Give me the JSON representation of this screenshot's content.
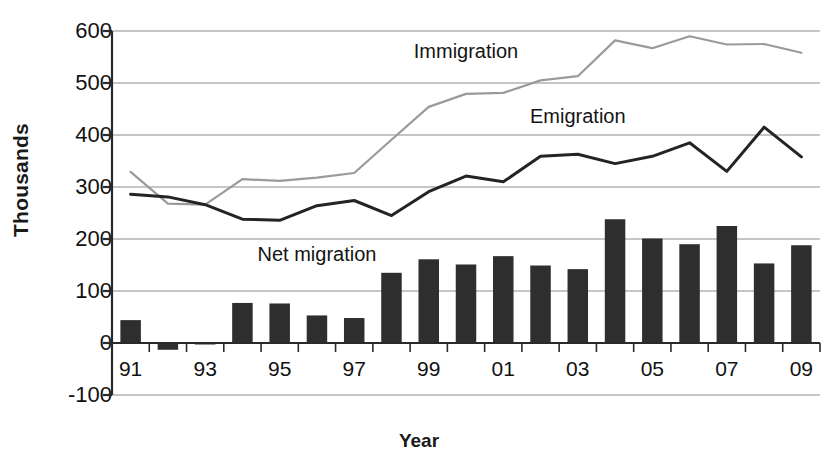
{
  "chart_data": {
    "type": "bar",
    "title": "",
    "xlabel": "Year",
    "ylabel": "Thousands",
    "ylim": [
      -100,
      600
    ],
    "ytick_values": [
      600,
      500,
      400,
      300,
      200,
      100,
      0,
      -100
    ],
    "ytick_labels": [
      "600",
      "500",
      "400",
      "300",
      "200",
      "100",
      "0",
      "-100"
    ],
    "grid": true,
    "legend_position": "inline-annotations",
    "categories": [
      "1991",
      "1992",
      "1993",
      "1994",
      "1995",
      "1996",
      "1997",
      "1998",
      "1999",
      "2000",
      "2001",
      "2002",
      "2003",
      "2004",
      "2005",
      "2006",
      "2007",
      "2008",
      "2009"
    ],
    "xtick_labels": [
      "91",
      "93",
      "95",
      "97",
      "99",
      "01",
      "03",
      "05",
      "07",
      "09"
    ],
    "xtick_categories": [
      "1991",
      "1993",
      "1995",
      "1997",
      "1999",
      "2001",
      "2003",
      "2005",
      "2007",
      "2009"
    ],
    "series": [
      {
        "name": "Net migration",
        "type": "bar",
        "color": "#2e2e2e",
        "values": [
          44,
          -13,
          -1,
          77,
          76,
          53,
          48,
          135,
          161,
          151,
          167,
          149,
          142,
          238,
          201,
          190,
          225,
          153,
          188
        ]
      },
      {
        "name": "Immigration",
        "type": "line",
        "color": "#9a9a9a",
        "values": [
          329,
          268,
          266,
          315,
          312,
          318,
          327,
          391,
          454,
          479,
          481,
          505,
          513,
          582,
          567,
          590,
          574,
          575,
          558
        ]
      },
      {
        "name": "Emigration",
        "type": "line",
        "color": "#242424",
        "values": [
          286,
          281,
          266,
          238,
          236,
          264,
          274,
          245,
          291,
          321,
          310,
          359,
          363,
          345,
          359,
          385,
          330,
          415,
          358
        ]
      }
    ],
    "annotations": [
      {
        "text": "Immigration",
        "at_category": "2000",
        "at_value": 562
      },
      {
        "text": "Emigration",
        "at_category": "2003",
        "at_value": 437
      },
      {
        "text": "Net migration",
        "at_category": "1996",
        "at_value": 172
      }
    ]
  }
}
